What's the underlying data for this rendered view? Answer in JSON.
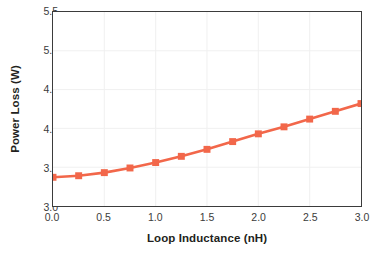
{
  "chart_data": {
    "type": "line",
    "title": "",
    "subtitle": "",
    "xlabel": "Loop Inductance (nH)",
    "ylabel": "Power Loss (W)",
    "xlim": [
      0.0,
      3.0
    ],
    "ylim": [
      3.0,
      5.5
    ],
    "xticks": [
      0.0,
      0.5,
      1.0,
      1.5,
      2.0,
      2.5,
      3.0
    ],
    "xticklabels": [
      "0.0",
      "0.5",
      "1.0",
      "1.5",
      "2.0",
      "2.5",
      "3.0"
    ],
    "yticks": [
      3.0,
      3.5,
      4.0,
      4.5,
      5.0,
      5.5
    ],
    "yticklabels": [
      "3.0",
      "3.5",
      "4.0",
      "4.5",
      "5.0",
      "5.5"
    ],
    "grid": true,
    "grid_color": "#f0f0f0",
    "legend": null,
    "legend_position": "none",
    "annotations": [],
    "series": [
      {
        "name": "Power Loss",
        "color": "#f2674a",
        "marker": "square",
        "marker_size": 7,
        "line_width": 2.6,
        "x": [
          0.0,
          0.25,
          0.5,
          0.75,
          1.0,
          1.25,
          1.5,
          1.75,
          2.0,
          2.25,
          2.5,
          2.75,
          3.0
        ],
        "values": [
          3.37,
          3.39,
          3.43,
          3.49,
          3.56,
          3.64,
          3.73,
          3.83,
          3.93,
          4.02,
          4.12,
          4.22,
          4.32
        ]
      }
    ]
  }
}
